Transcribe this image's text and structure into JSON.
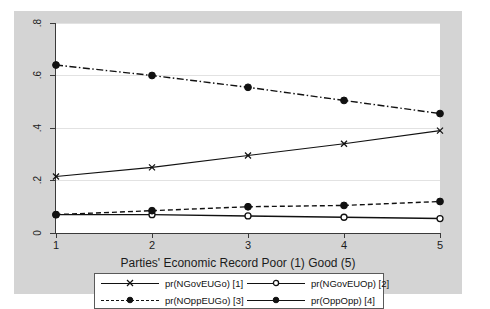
{
  "chart_data": {
    "type": "line",
    "title": "",
    "xlabel": "Parties' Economic Record Poor (1) Good (5)",
    "ylabel": "",
    "x": [
      1,
      2,
      3,
      4,
      5
    ],
    "xtick_labels": [
      "1",
      "2",
      "3",
      "4",
      "5"
    ],
    "ytick_labels": [
      ".8",
      ".6",
      ".4",
      ".2",
      "0"
    ],
    "ytick_values": [
      0.8,
      0.6,
      0.4,
      0.2,
      0
    ],
    "xlim": [
      1,
      5
    ],
    "ylim": [
      0,
      0.8
    ],
    "grid": "horizontal",
    "legend_position": "bottom",
    "series": [
      {
        "name": "pr(NGovEUGo) [1]",
        "values": [
          0.215,
          0.25,
          0.295,
          0.34,
          0.39
        ],
        "line_style": "solid",
        "marker": "cross",
        "color": "#111111"
      },
      {
        "name": "pr(NGovEUOp) [2]",
        "values": [
          0.07,
          0.07,
          0.065,
          0.06,
          0.055
        ],
        "line_style": "solid",
        "marker": "circle-open",
        "color": "#111111"
      },
      {
        "name": "pr(NOppEUGo) [3]",
        "values": [
          0.07,
          0.085,
          0.1,
          0.105,
          0.12
        ],
        "line_style": "dashed",
        "marker": "circle-filled",
        "color": "#111111"
      },
      {
        "name": "pr(OppOpp) [4]",
        "values": [
          0.64,
          0.6,
          0.555,
          0.505,
          0.455
        ],
        "line_style": "dash-dot",
        "marker": "circle-filled",
        "color": "#111111"
      }
    ]
  },
  "figure": {
    "background_color": "#d4d4d4",
    "plot_background_color": "#ffffff",
    "gridline_color": "#e2e2e2",
    "axis_color": "#3a3a3a"
  },
  "axis": {
    "x_title": "Parties' Economic Record Poor (1) Good (5)",
    "x_ticks": [
      "1",
      "2",
      "3",
      "4",
      "5"
    ],
    "y_ticks": [
      ".8",
      ".6",
      ".4",
      ".2",
      "0"
    ]
  },
  "legend": {
    "entries": [
      {
        "label": "pr(NGovEUGo) [1]",
        "style": "solid",
        "marker": "cross"
      },
      {
        "label": "pr(NGovEUOp) [2]",
        "style": "solid",
        "marker": "circle-open"
      },
      {
        "label": "pr(NOppEUGo) [3]",
        "style": "dashed",
        "marker": "circle-filled"
      },
      {
        "label": "pr(OppOpp) [4]",
        "style": "dash-dot",
        "marker": "circle-filled"
      }
    ]
  }
}
